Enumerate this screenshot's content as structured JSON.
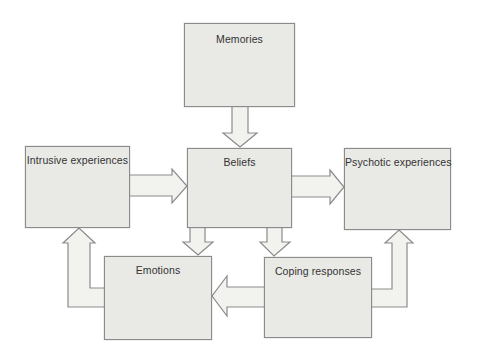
{
  "diagram": {
    "colors": {
      "background": "#ffffff",
      "box_fill": "#e9e9e6",
      "box_border": "#8b8b8b",
      "arrow_fill": "#f2f2ef",
      "arrow_border": "#8b8b8b",
      "text": "#333333"
    },
    "nodes": [
      {
        "id": "memories",
        "label": "Memories"
      },
      {
        "id": "intrusive",
        "label": "Intrusive experiences"
      },
      {
        "id": "beliefs",
        "label": "Beliefs"
      },
      {
        "id": "psychotic",
        "label": "Psychotic experiences"
      },
      {
        "id": "emotions",
        "label": "Emotions"
      },
      {
        "id": "coping",
        "label": "Coping responses"
      }
    ],
    "edges": [
      {
        "from": "Memories",
        "to": "Beliefs"
      },
      {
        "from": "Intrusive experiences",
        "to": "Beliefs"
      },
      {
        "from": "Beliefs",
        "to": "Psychotic experiences"
      },
      {
        "from": "Beliefs",
        "to": "Emotions"
      },
      {
        "from": "Beliefs",
        "to": "Coping responses"
      },
      {
        "from": "Coping responses",
        "to": "Emotions"
      },
      {
        "from": "Emotions",
        "to": "Intrusive experiences"
      },
      {
        "from": "Coping responses",
        "to": "Psychotic experiences"
      }
    ]
  }
}
